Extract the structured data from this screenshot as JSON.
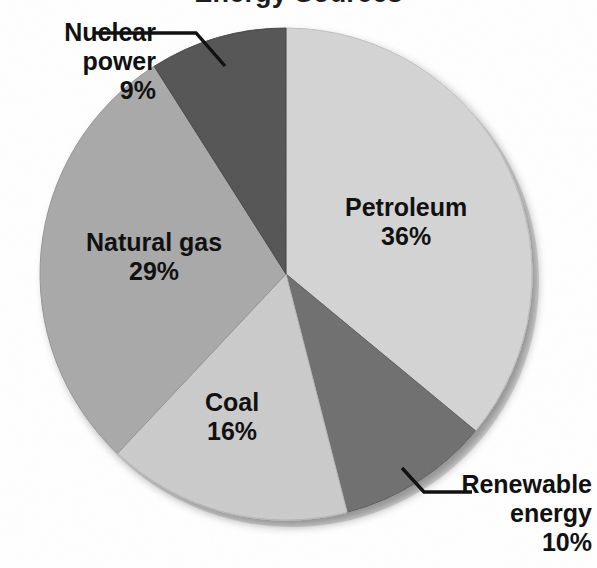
{
  "figure": {
    "title_fragment": "Energy Sources",
    "background_color": "#ffffff",
    "text_color": "#111111"
  },
  "chart_data": {
    "type": "pie",
    "title": "Energy Sources",
    "xlabel": "",
    "ylabel": "",
    "grid": false,
    "legend_position": "none",
    "label_style": "slice-labels-with-leader-lines",
    "start_angle_deg": 0,
    "direction": "clockwise",
    "units": "percent",
    "total": 100,
    "categories": [
      "Petroleum",
      "Renewable energy",
      "Coal",
      "Natural gas",
      "Nuclear power"
    ],
    "values": [
      36,
      10,
      16,
      29,
      9
    ],
    "slices": [
      {
        "label": "Petroleum",
        "value": 36,
        "value_text": "36%",
        "color": "#d4d4d4",
        "label_placement": "inside",
        "start_deg": 0,
        "end_deg": 129.6
      },
      {
        "label": "Renewable energy",
        "value": 10,
        "value_text": "10%",
        "color": "#6f6f6f",
        "label_placement": "outside",
        "start_deg": 129.6,
        "end_deg": 165.6
      },
      {
        "label": "Coal",
        "value": 16,
        "value_text": "16%",
        "color": "#cbcbcb",
        "label_placement": "inside",
        "start_deg": 165.6,
        "end_deg": 223.2
      },
      {
        "label": "Natural gas",
        "value": 29,
        "value_text": "29%",
        "color": "#a9a9a9",
        "label_placement": "inside",
        "start_deg": 223.2,
        "end_deg": 327.6
      },
      {
        "label": "Nuclear power",
        "value": 9,
        "value_text": "9%",
        "color": "#555555",
        "label_placement": "outside",
        "start_deg": 327.6,
        "end_deg": 360
      }
    ],
    "annotations": [
      {
        "name": "nuclear-power-callout",
        "text_line_1": "Nuclear",
        "text_line_2": "power",
        "text_line_3": "9%",
        "leader_line": "horizontal-then-elbow-down-right"
      },
      {
        "name": "renewable-energy-callout",
        "text_line_1": "Renewable",
        "text_line_2": "energy",
        "text_line_3": "10%",
        "leader_line": "horizontal-then-elbow-up-left"
      }
    ]
  },
  "labels": {
    "petroleum": {
      "name": "Petroleum",
      "pct": "36%"
    },
    "natural_gas": {
      "name": "Natural gas",
      "pct": "29%"
    },
    "coal": {
      "name": "Coal",
      "pct": "16%"
    },
    "nuclear": {
      "name_line1": "Nuclear",
      "name_line2": "power",
      "pct": "9%"
    },
    "renewable": {
      "name_line1": "Renewable",
      "name_line2": "energy",
      "pct": "10%"
    }
  }
}
